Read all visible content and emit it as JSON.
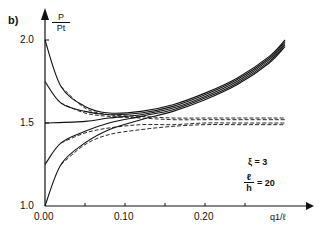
{
  "chart_data": {
    "type": "line",
    "panel_label": "b)",
    "title": "",
    "xlabel": "q1/ℓ",
    "ylabel": "P/Pt",
    "ylabel_num": "P",
    "ylabel_den": "Pt",
    "xlim": [
      0.0,
      0.33
    ],
    "ylim": [
      1.0,
      2.1
    ],
    "x_ticks": [
      0.0,
      0.05,
      0.1,
      0.15,
      0.2,
      0.25
    ],
    "x_tick_labels": [
      "0.00",
      "0.10",
      "0.20"
    ],
    "y_tick_labels": [
      "2.0",
      "1.5",
      "1.0"
    ],
    "annotations": [
      {
        "text": "ξ = 3"
      },
      {
        "text": "ℓ/h = 20",
        "num": "ℓ",
        "den": "h",
        "rest": "= 20"
      }
    ],
    "series": [
      {
        "name": "solid P0=2.0",
        "style": "solid",
        "x": [
          0.0,
          0.02,
          0.05,
          0.08,
          0.12,
          0.16,
          0.2,
          0.24,
          0.28,
          0.3
        ],
        "y": [
          2.0,
          1.72,
          1.6,
          1.56,
          1.57,
          1.61,
          1.68,
          1.77,
          1.9,
          2.0
        ]
      },
      {
        "name": "solid P0=1.75",
        "style": "solid",
        "x": [
          0.0,
          0.02,
          0.05,
          0.08,
          0.12,
          0.16,
          0.2,
          0.24,
          0.28,
          0.3
        ],
        "y": [
          1.75,
          1.62,
          1.57,
          1.55,
          1.56,
          1.6,
          1.67,
          1.76,
          1.89,
          1.99
        ]
      },
      {
        "name": "solid P0=1.5",
        "style": "solid",
        "x": [
          0.0,
          0.05,
          0.08,
          0.12,
          0.16,
          0.2,
          0.24,
          0.28,
          0.3
        ],
        "y": [
          1.5,
          1.51,
          1.53,
          1.55,
          1.59,
          1.66,
          1.75,
          1.88,
          1.98
        ]
      },
      {
        "name": "solid P0=1.25",
        "style": "solid",
        "x": [
          0.0,
          0.02,
          0.05,
          0.08,
          0.12,
          0.16,
          0.2,
          0.24,
          0.28,
          0.3
        ],
        "y": [
          1.25,
          1.38,
          1.45,
          1.5,
          1.54,
          1.58,
          1.65,
          1.74,
          1.87,
          1.97
        ]
      },
      {
        "name": "solid P0=1.0",
        "style": "solid",
        "x": [
          0.0,
          0.02,
          0.05,
          0.08,
          0.12,
          0.16,
          0.2,
          0.24,
          0.28,
          0.3
        ],
        "y": [
          1.0,
          1.25,
          1.38,
          1.46,
          1.52,
          1.57,
          1.64,
          1.73,
          1.86,
          1.96
        ]
      },
      {
        "name": "dashed P0=2.0",
        "style": "dashed",
        "x": [
          0.02,
          0.05,
          0.08,
          0.12,
          0.16,
          0.2,
          0.24,
          0.3
        ],
        "y": [
          1.72,
          1.59,
          1.55,
          1.54,
          1.53,
          1.53,
          1.53,
          1.53
        ]
      },
      {
        "name": "dashed P0=1.75",
        "style": "dashed",
        "x": [
          0.02,
          0.05,
          0.08,
          0.12,
          0.16,
          0.2,
          0.24,
          0.3
        ],
        "y": [
          1.62,
          1.56,
          1.54,
          1.53,
          1.52,
          1.52,
          1.52,
          1.52
        ]
      },
      {
        "name": "dashed P0=1.25",
        "style": "dashed",
        "x": [
          0.02,
          0.05,
          0.08,
          0.12,
          0.16,
          0.2,
          0.24,
          0.3
        ],
        "y": [
          1.38,
          1.44,
          1.47,
          1.49,
          1.49,
          1.5,
          1.5,
          1.5
        ]
      },
      {
        "name": "dashed P0=1.0",
        "style": "dashed",
        "x": [
          0.02,
          0.05,
          0.08,
          0.12,
          0.16,
          0.2,
          0.24,
          0.3
        ],
        "y": [
          1.25,
          1.37,
          1.43,
          1.46,
          1.48,
          1.49,
          1.49,
          1.49
        ]
      }
    ],
    "grid": false,
    "legend": "none"
  }
}
